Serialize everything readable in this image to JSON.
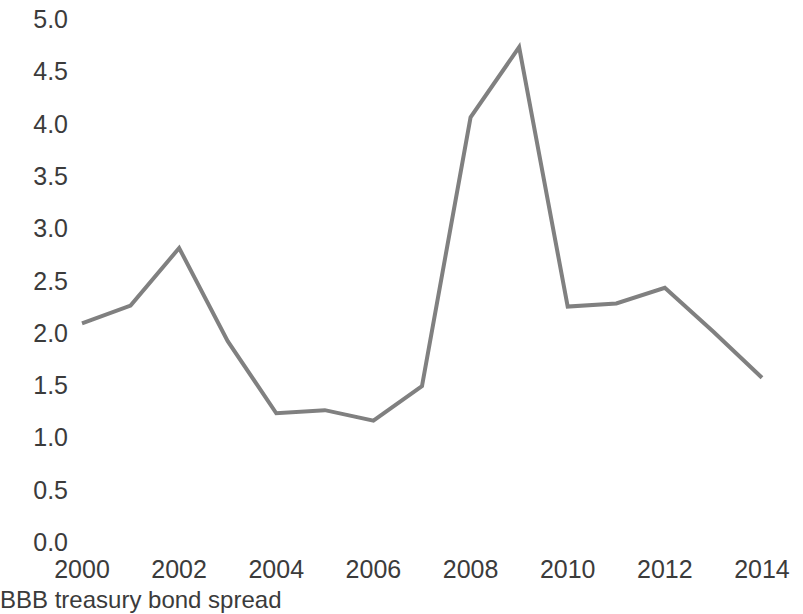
{
  "chart_data": {
    "type": "line",
    "title": "",
    "caption": "BBB treasury bond spread",
    "xlabel": "",
    "ylabel": "",
    "x": [
      2000,
      2001,
      2002,
      2003,
      2004,
      2005,
      2006,
      2007,
      2008,
      2009,
      2010,
      2011,
      2012,
      2013,
      2014
    ],
    "values": [
      2.1,
      2.27,
      2.82,
      1.93,
      1.24,
      1.27,
      1.17,
      1.5,
      4.07,
      4.74,
      2.26,
      2.29,
      2.44,
      2.02,
      1.58
    ],
    "series": [
      {
        "name": "BBB treasury bond spread",
        "color": "#808080",
        "values": [
          2.1,
          2.27,
          2.82,
          1.93,
          1.24,
          1.27,
          1.17,
          1.5,
          4.07,
          4.74,
          2.26,
          2.29,
          2.44,
          2.02,
          1.58
        ]
      }
    ],
    "xlim": [
      2000,
      2014
    ],
    "ylim": [
      0.0,
      5.0
    ],
    "y_ticks": [
      "0.0",
      "0.5",
      "1.0",
      "1.5",
      "2.0",
      "2.5",
      "3.0",
      "3.5",
      "4.0",
      "4.5",
      "5.0"
    ],
    "y_tick_values": [
      0.0,
      0.5,
      1.0,
      1.5,
      2.0,
      2.5,
      3.0,
      3.5,
      4.0,
      4.5,
      5.0
    ],
    "x_ticks": [
      "2000",
      "2002",
      "2004",
      "2006",
      "2008",
      "2010",
      "2012",
      "2014"
    ],
    "x_tick_values": [
      2000,
      2002,
      2004,
      2006,
      2008,
      2010,
      2012,
      2014
    ],
    "grid": false,
    "legend": "none",
    "line_color": "#808080",
    "line_width": 4,
    "markers": false,
    "background": "#ffffff"
  }
}
